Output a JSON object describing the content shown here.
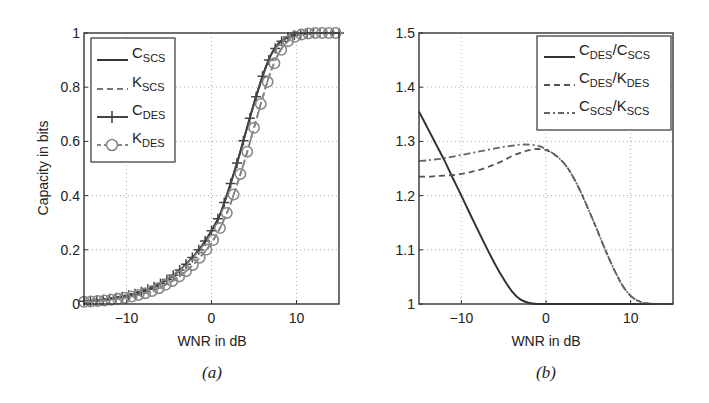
{
  "chart_data": [
    {
      "type": "line",
      "panel_label": "(a)",
      "title": "",
      "xlabel": "WNR in dB",
      "ylabel": "Capacity in bits",
      "xlim": [
        -15,
        15
      ],
      "ylim": [
        0,
        1
      ],
      "xticks": [
        -10,
        0,
        10
      ],
      "xtick_labels": [
        "−10",
        "0",
        "10"
      ],
      "yticks": [
        0,
        0.2,
        0.4,
        0.6,
        0.8,
        1
      ],
      "ytick_labels": [
        "0",
        "0.2",
        "0.4",
        "0.6",
        "0.8",
        "1"
      ],
      "grid": true,
      "legend_position": "upper left",
      "x": [
        -15,
        -14,
        -13,
        -12,
        -11,
        -10,
        -9,
        -8,
        -7,
        -6,
        -5,
        -4,
        -3,
        -2,
        -1,
        0,
        1,
        2,
        3,
        4,
        5,
        6,
        7,
        8,
        9,
        10,
        11,
        12,
        13,
        14,
        15
      ],
      "series": [
        {
          "name": "C_SCS",
          "main": "C",
          "sub": "SCS",
          "style": "solid",
          "color": "#333333",
          "values": [
            0.01,
            0.012,
            0.015,
            0.019,
            0.024,
            0.03,
            0.038,
            0.048,
            0.06,
            0.076,
            0.095,
            0.118,
            0.147,
            0.18,
            0.22,
            0.27,
            0.33,
            0.42,
            0.52,
            0.63,
            0.74,
            0.84,
            0.92,
            0.965,
            0.985,
            0.995,
            0.998,
            1.0,
            1.0,
            1.0,
            1.0
          ]
        },
        {
          "name": "K_SCS",
          "main": "K",
          "sub": "SCS",
          "style": "dashed",
          "color": "#777777",
          "values": [
            0.008,
            0.01,
            0.012,
            0.015,
            0.019,
            0.024,
            0.03,
            0.038,
            0.048,
            0.061,
            0.077,
            0.097,
            0.121,
            0.15,
            0.185,
            0.225,
            0.28,
            0.35,
            0.44,
            0.54,
            0.65,
            0.76,
            0.86,
            0.93,
            0.97,
            0.99,
            0.997,
            1.0,
            1.0,
            1.0,
            1.0
          ]
        },
        {
          "name": "C_DES",
          "main": "C",
          "sub": "DES",
          "style": "solid-plus",
          "color": "#444444",
          "values": [
            0.01,
            0.012,
            0.015,
            0.019,
            0.024,
            0.03,
            0.038,
            0.048,
            0.06,
            0.076,
            0.095,
            0.118,
            0.147,
            0.18,
            0.22,
            0.27,
            0.33,
            0.42,
            0.52,
            0.63,
            0.74,
            0.84,
            0.92,
            0.965,
            0.985,
            0.995,
            0.998,
            1.0,
            1.0,
            1.0,
            1.0
          ]
        },
        {
          "name": "K_DES",
          "main": "K",
          "sub": "DES",
          "style": "dashdot-circle",
          "color": "#888888",
          "values": [
            0.008,
            0.01,
            0.012,
            0.015,
            0.019,
            0.024,
            0.03,
            0.038,
            0.048,
            0.061,
            0.077,
            0.097,
            0.121,
            0.15,
            0.185,
            0.225,
            0.28,
            0.35,
            0.44,
            0.54,
            0.65,
            0.76,
            0.86,
            0.93,
            0.97,
            0.99,
            0.997,
            1.0,
            1.0,
            1.0,
            1.0
          ]
        }
      ]
    },
    {
      "type": "line",
      "panel_label": "(b)",
      "title": "",
      "xlabel": "WNR in dB",
      "ylabel": "",
      "xlim": [
        -15,
        15
      ],
      "ylim": [
        1,
        1.5
      ],
      "xticks": [
        -10,
        0,
        10
      ],
      "xtick_labels": [
        "−10",
        "0",
        "10"
      ],
      "yticks": [
        1,
        1.1,
        1.2,
        1.3,
        1.4,
        1.5
      ],
      "ytick_labels": [
        "1",
        "1.1",
        "1.2",
        "1.3",
        "1.4",
        "1.5"
      ],
      "grid": true,
      "legend_position": "upper right",
      "x": [
        -15,
        -14,
        -13,
        -12,
        -11,
        -10,
        -9,
        -8,
        -7,
        -6,
        -5,
        -4,
        -3,
        -2,
        -1,
        0,
        1,
        2,
        3,
        4,
        5,
        6,
        7,
        8,
        9,
        10,
        11,
        12,
        13,
        14,
        15
      ],
      "series": [
        {
          "name": "C_DES/C_SCS",
          "num_main": "C",
          "num_sub": "DES",
          "den_main": "K",
          "den_sub": "SCS",
          "den_is_C": true,
          "style": "solid",
          "color": "#333333",
          "values": [
            1.355,
            1.325,
            1.295,
            1.265,
            1.232,
            1.2,
            1.167,
            1.135,
            1.103,
            1.073,
            1.046,
            1.023,
            1.008,
            1.002,
            1.0,
            1.0,
            1.0,
            1.0,
            1.0,
            1.0,
            1.0,
            1.0,
            1.0,
            1.0,
            1.0,
            1.0,
            1.0,
            1.0,
            1.0,
            1.0,
            1.0
          ]
        },
        {
          "name": "C_DES/K_DES",
          "num_main": "C",
          "num_sub": "DES",
          "den_main": "K",
          "den_sub": "DES",
          "style": "dashed",
          "color": "#555555",
          "values": [
            1.235,
            1.235,
            1.236,
            1.237,
            1.238,
            1.24,
            1.243,
            1.247,
            1.252,
            1.258,
            1.265,
            1.273,
            1.279,
            1.284,
            1.286,
            1.284,
            1.276,
            1.262,
            1.24,
            1.21,
            1.175,
            1.138,
            1.1,
            1.065,
            1.035,
            1.015,
            1.005,
            1.001,
            1.0,
            1.0,
            1.0
          ]
        },
        {
          "name": "C_SCS/K_SCS",
          "num_main": "C",
          "num_sub": "SCS",
          "den_main": "K",
          "den_sub": "SCS",
          "style": "dashdot",
          "color": "#666666",
          "values": [
            1.264,
            1.265,
            1.267,
            1.269,
            1.272,
            1.275,
            1.278,
            1.281,
            1.284,
            1.287,
            1.29,
            1.292,
            1.294,
            1.294,
            1.292,
            1.286,
            1.276,
            1.262,
            1.24,
            1.21,
            1.175,
            1.138,
            1.1,
            1.065,
            1.035,
            1.015,
            1.005,
            1.001,
            1.0,
            1.0,
            1.0
          ]
        }
      ]
    }
  ]
}
